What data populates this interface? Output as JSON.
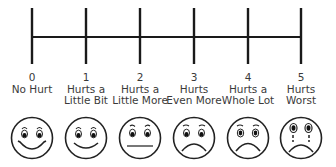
{
  "scale": {
    "line_color": "#1a1a1a",
    "tick_positions_x": [
      32,
      86,
      140,
      194,
      248,
      301
    ],
    "levels": [
      {
        "value": "0",
        "label_line1": "No Hurt",
        "label_line2": "",
        "face": "big-smile"
      },
      {
        "value": "1",
        "label_line1": "Hurts a",
        "label_line2": "Little Bit",
        "face": "smile"
      },
      {
        "value": "2",
        "label_line1": "Hurts a",
        "label_line2": "Little More",
        "face": "neutral"
      },
      {
        "value": "3",
        "label_line1": "Hurts",
        "label_line2": "Even More",
        "face": "slight-frown"
      },
      {
        "value": "4",
        "label_line1": "Hurts a",
        "label_line2": "Whole Lot",
        "face": "frown"
      },
      {
        "value": "5",
        "label_line1": "Hurts",
        "label_line2": "Worst",
        "face": "crying"
      }
    ]
  }
}
